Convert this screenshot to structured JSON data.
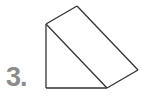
{
  "problem": {
    "number_label": "3."
  },
  "figure": {
    "shape": "triangular-prism",
    "stroke_color": "#333333",
    "label_color": "#8c8c8c",
    "vertices": {
      "A": [
        46,
        24
      ],
      "B": [
        77,
        6
      ],
      "C": [
        138,
        70
      ],
      "D": [
        107,
        88
      ],
      "E": [
        46,
        88
      ]
    },
    "edges": [
      [
        "A",
        "B"
      ],
      [
        "B",
        "C"
      ],
      [
        "C",
        "D"
      ],
      [
        "D",
        "E"
      ],
      [
        "E",
        "A"
      ],
      [
        "A",
        "D"
      ]
    ]
  }
}
